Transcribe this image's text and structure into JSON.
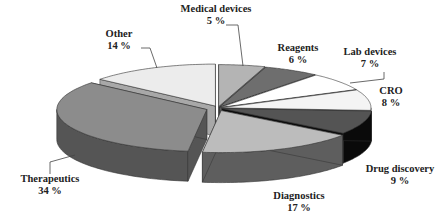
{
  "chart_data": {
    "type": "pie",
    "style": "3d-exploded",
    "title": "",
    "categories": [
      "Medical devices",
      "Reagents",
      "Lab devices",
      "CRO",
      "Drug discovery",
      "Diagnostics",
      "Therapeutics",
      "Other"
    ],
    "values": [
      5,
      6,
      7,
      8,
      9,
      17,
      34,
      14
    ],
    "unit": "%",
    "labels": [
      {
        "name": "Medical devices",
        "value": "5 %"
      },
      {
        "name": "Reagents",
        "value": "6 %"
      },
      {
        "name": "Lab devices",
        "value": "7 %"
      },
      {
        "name": "CRO",
        "value": "8 %"
      },
      {
        "name": "Drug discovery",
        "value": "9 %"
      },
      {
        "name": "Diagnostics",
        "value": "17 %"
      },
      {
        "name": "Therapeutics",
        "value": "34 %"
      },
      {
        "name": "Other",
        "value": "14 %"
      }
    ],
    "colors": [
      "#b4b4b4",
      "#6e6e6e",
      "#ffffff",
      "#f4f4f4",
      "#545454",
      "#bcbcbc",
      "#8c8c8c",
      "#ececec"
    ],
    "side_colors": [
      "#8a8a8a",
      "#4a4a4a",
      "#cfcfcf",
      "#c8c8c8",
      "#0a0a0a",
      "#5e5e5e",
      "#555555",
      "#a8a8a8"
    ],
    "legend": "none"
  }
}
